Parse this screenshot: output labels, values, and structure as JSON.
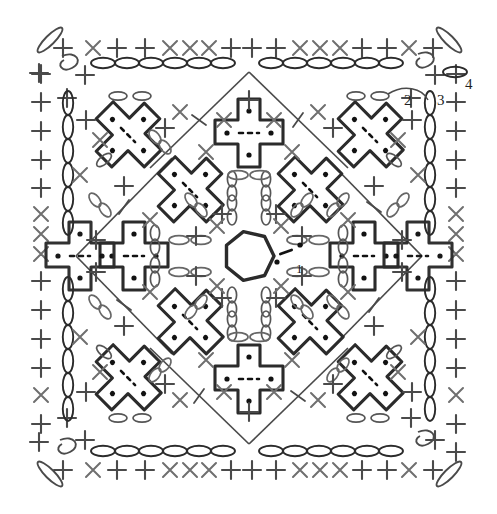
{
  "chart": {
    "type": "crochet-symbol-diagram",
    "background_color": "#ffffff",
    "ink_color": "#2b2b2b",
    "secondary_ink_color": "#6f6f6f",
    "canvas": {
      "width": 497,
      "height": 514
    }
  },
  "round_labels": [
    {
      "id": "label-round-1",
      "text": "1",
      "x": 296,
      "y": 268
    },
    {
      "id": "label-round-2",
      "text": "2",
      "x": 404,
      "y": 100
    },
    {
      "id": "label-round-3",
      "text": "3",
      "x": 437,
      "y": 100
    },
    {
      "id": "label-round-4",
      "text": "4",
      "x": 465,
      "y": 84
    }
  ],
  "legend_symbols": [
    {
      "name": "chain-oval",
      "meaning": "chain stitch (ch)"
    },
    {
      "name": "plus-cross",
      "meaning": "single crochet (sc)"
    },
    {
      "name": "x-cross",
      "meaning": "single crochet / decrease"
    },
    {
      "name": "slash-line",
      "meaning": "slip stitch chain start"
    },
    {
      "name": "dot",
      "meaning": "puff / bobble node"
    },
    {
      "name": "magic-ring",
      "meaning": "magic ring start"
    },
    {
      "name": "cross-motif",
      "meaning": "cross-shaped puff cluster motif"
    }
  ],
  "structure": {
    "center_ring": {
      "cx": 249,
      "cy": 256,
      "r": 25,
      "sides": 7
    },
    "border_rounds": 4,
    "top_edge_sc_count": 16,
    "bottom_edge_sc_count": 16,
    "left_edge_sc_count": 13,
    "right_edge_sc_count": 13,
    "cross_motifs_total": 12,
    "corner_motifs": 4,
    "frame": {
      "x": 68,
      "y": 44,
      "w": 362,
      "h": 424
    }
  }
}
